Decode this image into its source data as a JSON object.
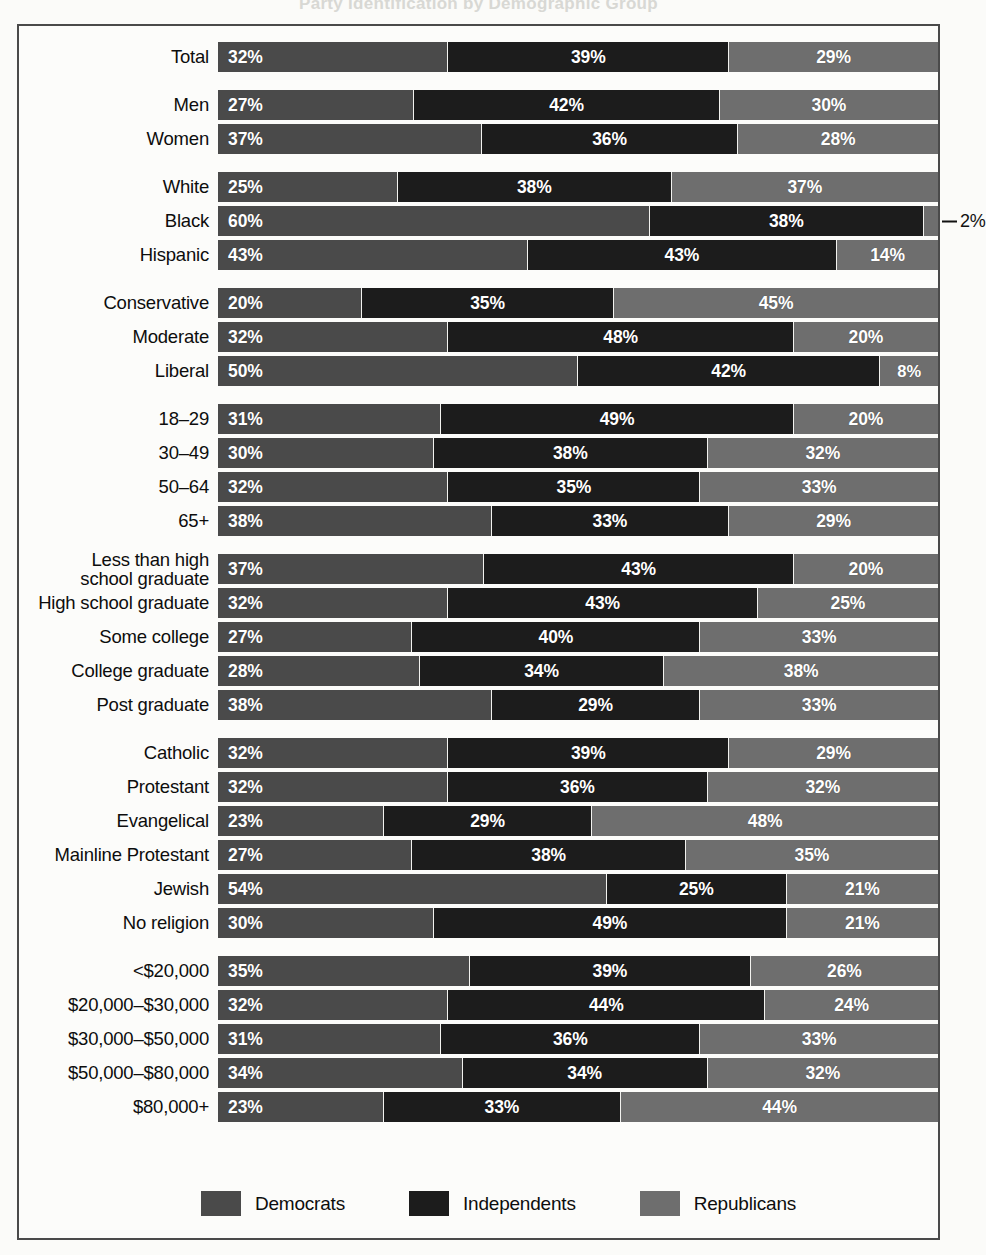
{
  "title": "Party Identification by Demographic Group",
  "colors": {
    "democrats": "#4a4a4a",
    "independents": "#1c1c1c",
    "republicans": "#6e6e6e",
    "gap": "#f2f2ef",
    "frame": "#4a4a4a",
    "page_background": "#fbfbf9",
    "value_text": "#ffffff",
    "label_text": "#0d0d0d"
  },
  "legend": {
    "items": [
      {
        "label": "Democrats",
        "color": "#4a4a4a"
      },
      {
        "label": "Independents",
        "color": "#1c1c1c"
      },
      {
        "label": "Republicans",
        "color": "#6e6e6e"
      }
    ]
  },
  "chart_data": {
    "type": "bar",
    "subtype": "stacked-horizontal-100",
    "title": "Party Identification by Demographic Group",
    "xlabel": "",
    "ylabel": "",
    "xlim": [
      0,
      100
    ],
    "grid": false,
    "legend_position": "bottom",
    "value_suffix": "%",
    "series": [
      {
        "name": "Democrats",
        "color": "#4a4a4a"
      },
      {
        "name": "Independents",
        "color": "#1c1c1c"
      },
      {
        "name": "Republicans",
        "color": "#6e6e6e"
      }
    ],
    "categories": [
      "Total",
      "Men",
      "Women",
      "White",
      "Black",
      "Hispanic",
      "Conservative",
      "Moderate",
      "Liberal",
      "18–29",
      "30–49",
      "50–64",
      "65+",
      "Less than high school graduate",
      "High school graduate",
      "Some college",
      "College graduate",
      "Post graduate",
      "Catholic",
      "Protestant",
      "Evangelical",
      "Mainline Protestant",
      "Jewish",
      "No religion",
      "<$20,000",
      "$20,000–$30,000",
      "$30,000–$50,000",
      "$50,000–$80,000",
      "$80,000+"
    ],
    "values": {
      "Democrats": [
        32,
        27,
        37,
        25,
        60,
        43,
        20,
        32,
        50,
        31,
        30,
        32,
        38,
        37,
        32,
        27,
        28,
        38,
        32,
        32,
        23,
        27,
        54,
        30,
        35,
        32,
        31,
        34,
        23
      ],
      "Independents": [
        39,
        42,
        36,
        38,
        38,
        43,
        35,
        48,
        42,
        49,
        38,
        35,
        33,
        43,
        43,
        40,
        34,
        29,
        39,
        36,
        29,
        38,
        25,
        49,
        39,
        44,
        36,
        34,
        33
      ],
      "Republicans": [
        29,
        30,
        28,
        37,
        2,
        14,
        45,
        20,
        8,
        20,
        32,
        33,
        29,
        20,
        25,
        33,
        38,
        33,
        29,
        32,
        48,
        35,
        21,
        21,
        26,
        24,
        33,
        32,
        44
      ]
    }
  },
  "groups": [
    {
      "name": "total",
      "rows": [
        {
          "label": "Total",
          "values": [
            32,
            39,
            29
          ]
        }
      ]
    },
    {
      "name": "gender",
      "rows": [
        {
          "label": "Men",
          "values": [
            27,
            42,
            30
          ]
        },
        {
          "label": "Women",
          "values": [
            37,
            36,
            28
          ]
        }
      ]
    },
    {
      "name": "race",
      "rows": [
        {
          "label": "White",
          "values": [
            25,
            38,
            37
          ]
        },
        {
          "label": "Black",
          "values": [
            60,
            38,
            2
          ],
          "callout": "2%"
        },
        {
          "label": "Hispanic",
          "values": [
            43,
            43,
            14
          ]
        }
      ]
    },
    {
      "name": "ideology",
      "rows": [
        {
          "label": "Conservative",
          "values": [
            20,
            35,
            45
          ]
        },
        {
          "label": "Moderate",
          "values": [
            32,
            48,
            20
          ]
        },
        {
          "label": "Liberal",
          "values": [
            50,
            42,
            8
          ]
        }
      ]
    },
    {
      "name": "age",
      "rows": [
        {
          "label": "18–29",
          "values": [
            31,
            49,
            20
          ]
        },
        {
          "label": "30–49",
          "values": [
            30,
            38,
            32
          ]
        },
        {
          "label": "50–64",
          "values": [
            32,
            35,
            33
          ]
        },
        {
          "label": "65+",
          "values": [
            38,
            33,
            29
          ]
        }
      ]
    },
    {
      "name": "education",
      "rows": [
        {
          "label": "Less than high\nschool graduate",
          "values": [
            37,
            43,
            20
          ],
          "two_line": true
        },
        {
          "label": "High school graduate",
          "values": [
            32,
            43,
            25
          ]
        },
        {
          "label": "Some college",
          "values": [
            27,
            40,
            33
          ]
        },
        {
          "label": "College graduate",
          "values": [
            28,
            34,
            38
          ]
        },
        {
          "label": "Post graduate",
          "values": [
            38,
            29,
            33
          ]
        }
      ]
    },
    {
      "name": "religion",
      "rows": [
        {
          "label": "Catholic",
          "values": [
            32,
            39,
            29
          ]
        },
        {
          "label": "Protestant",
          "values": [
            32,
            36,
            32
          ]
        },
        {
          "label": "Evangelical",
          "values": [
            23,
            29,
            48
          ]
        },
        {
          "label": "Mainline Protestant",
          "values": [
            27,
            38,
            35
          ]
        },
        {
          "label": "Jewish",
          "values": [
            54,
            25,
            21
          ]
        },
        {
          "label": "No religion",
          "values": [
            30,
            49,
            21
          ]
        }
      ]
    },
    {
      "name": "income",
      "rows": [
        {
          "label": "<$20,000",
          "values": [
            35,
            39,
            26
          ]
        },
        {
          "label": "$20,000–$30,000",
          "values": [
            32,
            44,
            24
          ]
        },
        {
          "label": "$30,000–$50,000",
          "values": [
            31,
            36,
            33
          ]
        },
        {
          "label": "$50,000–$80,000",
          "values": [
            34,
            34,
            32
          ]
        },
        {
          "label": "$80,000+",
          "values": [
            23,
            33,
            44
          ]
        }
      ]
    }
  ]
}
